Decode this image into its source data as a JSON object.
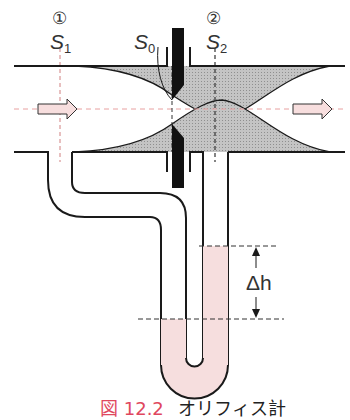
{
  "labels": {
    "station1": "①",
    "station2": "②",
    "s1": "S",
    "s1_sub": "1",
    "s0": "S",
    "s0_sub": "0",
    "s2": "S",
    "s2_sub": "2",
    "delta_h": "Δh"
  },
  "caption": {
    "figure_number": "図 12.2",
    "title": "オリフィス計"
  },
  "colors": {
    "line": "#1a1a1a",
    "flow_shading": "#b5b5b5",
    "liquid": "#f6dede",
    "arrow_fill": "#f7dede",
    "centerline": "#e8a0a0",
    "caption_accent": "#e0475e"
  }
}
